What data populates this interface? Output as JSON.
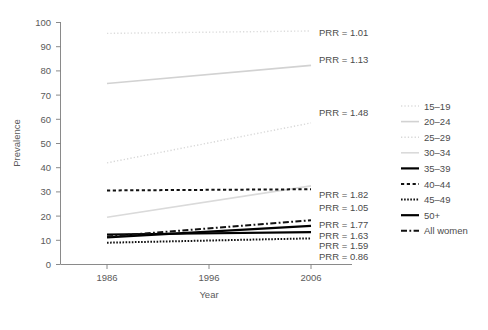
{
  "chart_data": {
    "type": "line",
    "title": "",
    "xlabel": "Year",
    "ylabel": "Prevalence",
    "x": [
      1986,
      2006
    ],
    "xticks": [
      1986,
      1996,
      2006
    ],
    "xtick_labels": [
      "1986",
      "1996",
      "2006"
    ],
    "xlim": [
      1981,
      2011
    ],
    "yticks": [
      0,
      10,
      20,
      30,
      40,
      50,
      60,
      70,
      80,
      90,
      100
    ],
    "ytick_labels": [
      "0",
      "10",
      "20",
      "30",
      "40",
      "50",
      "60",
      "70",
      "80",
      "90",
      "100"
    ],
    "ylim": [
      0,
      100
    ],
    "grid": false,
    "legend_position": "right",
    "series": [
      {
        "name": "15-19",
        "legend_label": "15–19",
        "values": [
          95.5,
          96.5
        ],
        "prr": "PRR = 1.01",
        "prr_value": 1.01,
        "color": "#dcdcdc",
        "style": "fine-dotted",
        "width": 1.4,
        "label_y": 96.5
      },
      {
        "name": "20-24",
        "legend_label": "20–24",
        "values": [
          74.8,
          82.3
        ],
        "prr": "PRR = 1.13",
        "prr_value": 1.13,
        "color": "#d2d2d2",
        "style": "solid",
        "width": 1.6,
        "label_y": 82.3
      },
      {
        "name": "25-29",
        "legend_label": "25–29",
        "values": [
          42.0,
          58.5
        ],
        "prr": "PRR = 1.48",
        "prr_value": 1.48,
        "color": "#d8d8d8",
        "style": "fine-dotted",
        "width": 1.4,
        "label_y": 60.0
      },
      {
        "name": "30-34",
        "legend_label": "30–34",
        "values": [
          19.5,
          32.5
        ],
        "prr": "PRR = 1.82",
        "prr_value": 1.82,
        "color": "#dadada",
        "style": "solid",
        "width": 1.6,
        "label_y": 33.0
      },
      {
        "name": "35-39",
        "legend_label": "35–39",
        "values": [
          12.4,
          13.4
        ],
        "prr": "PRR = 1.59",
        "prr_value": 1.59,
        "color": "#000000",
        "style": "solid",
        "width": 2.2,
        "label_y": 13.2
      },
      {
        "name": "40-44",
        "legend_label": "40–44",
        "values": [
          30.6,
          31.1
        ],
        "prr": "PRR = 1.05",
        "prr_value": 1.05,
        "color": "#111111",
        "style": "dashed",
        "width": 2.0,
        "label_y": 30.6
      },
      {
        "name": "45-49",
        "legend_label": "45–49",
        "values": [
          9.0,
          10.8
        ],
        "prr": "PRR = 0.86",
        "prr_value": 0.86,
        "color": "#111111",
        "style": "dense-dotted",
        "width": 2.0,
        "label_y": 9.8
      },
      {
        "name": "50+",
        "legend_label": "50+",
        "values": [
          11.2,
          16.0
        ],
        "prr": "PRR = 1.63",
        "prr_value": 1.63,
        "color": "#000000",
        "style": "solid",
        "width": 2.2,
        "label_y": 16.2
      },
      {
        "name": "All women",
        "legend_label": "All women",
        "values": [
          11.6,
          18.3
        ],
        "prr": "PRR = 1.77",
        "prr_value": 1.77,
        "color": "#111111",
        "style": "dash-dot",
        "width": 2.0,
        "label_y": 19.6
      }
    ]
  },
  "legend": {
    "items": [
      {
        "label": "15–19"
      },
      {
        "label": "20–24"
      },
      {
        "label": "25–29"
      },
      {
        "label": "30–34"
      },
      {
        "label": "35–39"
      },
      {
        "label": "40–44"
      },
      {
        "label": "45–49"
      },
      {
        "label": "50+"
      },
      {
        "label": "All women"
      }
    ]
  },
  "prr_labels": [
    {
      "text": "PRR = 1.01",
      "y": 36
    },
    {
      "text": "PRR = 1.13",
      "y": 63
    },
    {
      "text": "PRR = 1.48",
      "y": 116
    },
    {
      "text": "PRR = 1.82",
      "y": 198
    },
    {
      "text": "PRR = 1.05",
      "y": 211
    },
    {
      "text": "PRR = 1.77",
      "y": 228
    },
    {
      "text": "PRR = 1.63",
      "y": 239
    },
    {
      "text": "PRR = 1.59",
      "y": 249
    },
    {
      "text": "PRR = 0.86",
      "y": 260
    }
  ],
  "axes": {
    "y_title": "Prevalence",
    "x_title": "Year"
  }
}
